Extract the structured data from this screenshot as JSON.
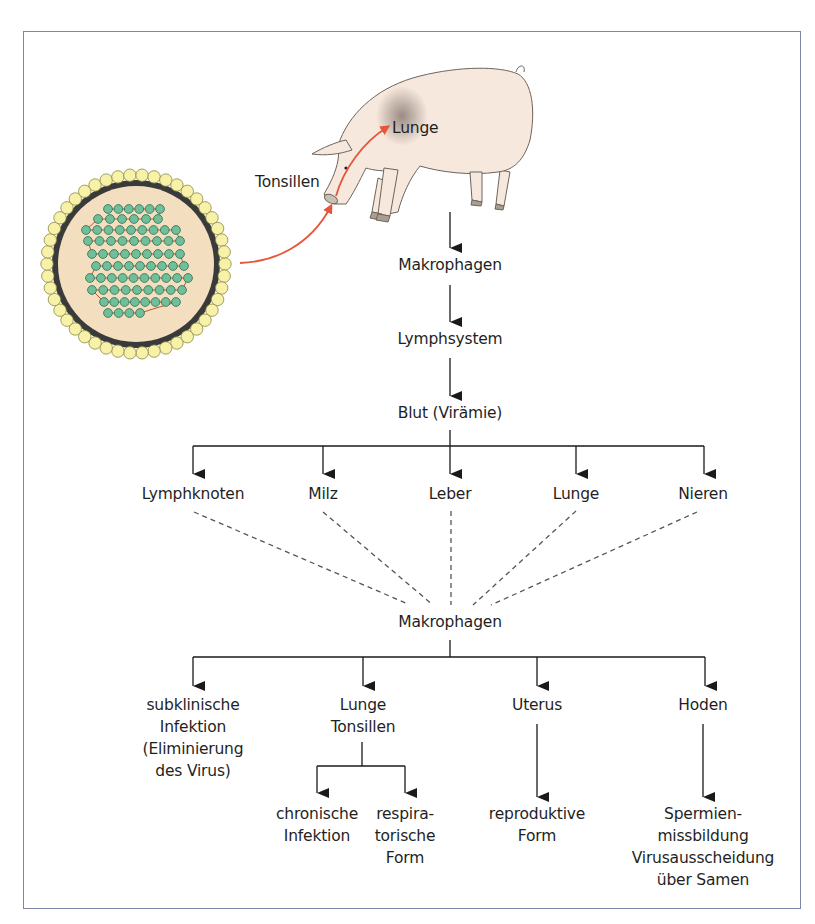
{
  "figure": {
    "frame_color": "#7d86a8",
    "arrow_color": "#1a1a1a",
    "infection_arrow_color": "#e8553a",
    "pig_color": "#f6e8dc",
    "virus": {
      "envelope_bead_color": "#f7f2a8",
      "capsid_color": "#f3dfbf",
      "nucleocapsid_bead_color": "#6fbf9a"
    }
  },
  "labels": {
    "tonsillen": "Tonsillen",
    "lunge_in_pig": "Lunge",
    "makrophagen_1": "Makrophagen",
    "lymphsystem": "Lymphsystem",
    "blut": "Blut (Virämie)",
    "organs": [
      "Lymphknoten",
      "Milz",
      "Leber",
      "Lunge",
      "Nieren"
    ],
    "makrophagen_2": "Makrophagen",
    "outcomes": {
      "subklinisch": [
        "subklinische",
        "Infektion",
        "(Eliminierung",
        "des Virus)"
      ],
      "lunge_tonsillen": [
        "Lunge",
        "Tonsillen"
      ],
      "uterus": "Uterus",
      "hoden": "Hoden"
    },
    "sub_outcomes": {
      "chronisch": [
        "chronische",
        "Infektion"
      ],
      "respiratorisch": [
        "respira-",
        "torische",
        "Form"
      ],
      "reproduktiv": [
        "reproduktive",
        "Form"
      ],
      "spermien": [
        "Spermien-",
        "missbildung",
        "Virusausscheidung",
        "über Samen"
      ]
    }
  }
}
